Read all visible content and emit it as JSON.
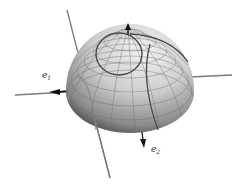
{
  "figure": {
    "type": "hemisphere with coordinate grid, curves and frame vectors",
    "labels": {
      "e1": "e",
      "e1_sub": "1",
      "e2": "e",
      "e2_sub": "2"
    },
    "colors": {
      "background": "#ffffff",
      "sphere_light": "#e6e6e6",
      "sphere_dark": "#555555",
      "grid": "#6e6e6e",
      "curve": "#4a4a4a",
      "axis_line": "#7a7a7a",
      "arrow": "#111111"
    }
  }
}
